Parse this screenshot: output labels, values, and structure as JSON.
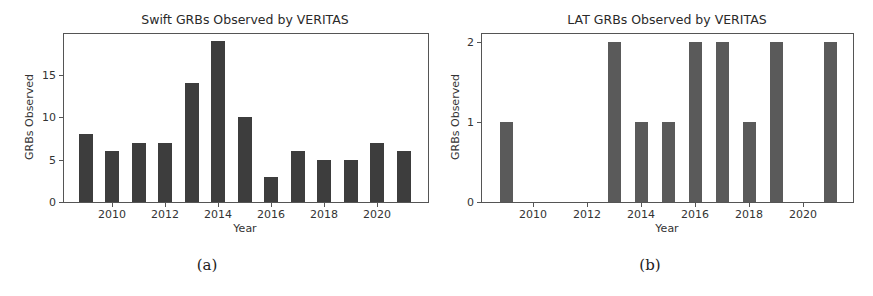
{
  "chart_data": [
    {
      "type": "bar",
      "title": "Swift GRBs Observed by VERITAS",
      "xlabel": "Year",
      "ylabel": "GRBs Observed",
      "categories": [
        2009,
        2010,
        2011,
        2012,
        2013,
        2014,
        2015,
        2016,
        2017,
        2018,
        2019,
        2020,
        2021
      ],
      "values": [
        8,
        6,
        7,
        7,
        14,
        19,
        10,
        3,
        6,
        5,
        5,
        7,
        6
      ],
      "xticks": [
        "2010",
        "2012",
        "2014",
        "2016",
        "2018",
        "2020"
      ],
      "yticks": [
        "0",
        "5",
        "10",
        "15"
      ],
      "ylim": [
        0,
        20
      ],
      "grid": false,
      "bar_color": "#3d3d3d",
      "caption": "(a)"
    },
    {
      "type": "bar",
      "title": "LAT GRBs Observed by VERITAS",
      "xlabel": "Year",
      "ylabel": "GRBs Observed",
      "categories": [
        2009,
        2010,
        2011,
        2012,
        2013,
        2014,
        2015,
        2016,
        2017,
        2018,
        2019,
        2020,
        2021
      ],
      "values": [
        1,
        0,
        0,
        0,
        2,
        1,
        1,
        2,
        2,
        1,
        2,
        0,
        2
      ],
      "xticks": [
        "2010",
        "2012",
        "2014",
        "2016",
        "2018",
        "2020"
      ],
      "yticks": [
        "0",
        "1",
        "2"
      ],
      "ylim": [
        0,
        2.1
      ],
      "grid": false,
      "bar_color": "#5a5a5a",
      "caption": "(b)"
    }
  ]
}
